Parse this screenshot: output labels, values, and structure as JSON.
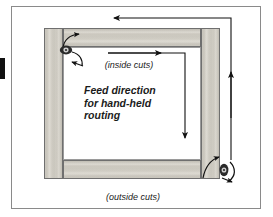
{
  "figure": {
    "title_text": "Feed direction for hand-held routing",
    "labels": {
      "inside_cuts": "(inside cuts)",
      "outside_cuts": "(outside cuts)",
      "feed_line1": "Feed direction",
      "feed_line2": "for hand-held",
      "feed_line3": "routing"
    },
    "colors": {
      "wood_light": "#dedbd3",
      "wood_mid": "#cbc8bf",
      "wood_dark": "#c6c3ba",
      "wood_outline": "#6f6f6f",
      "border": "#8a8a8a",
      "ink": "#111111",
      "background": "#ffffff"
    },
    "frame_parts": [
      {
        "name": "stile-left",
        "orientation": "vertical"
      },
      {
        "name": "stile-right",
        "orientation": "vertical"
      },
      {
        "name": "rail-top",
        "orientation": "horizontal"
      },
      {
        "name": "rail-bottom",
        "orientation": "horizontal"
      }
    ],
    "arrows": [
      {
        "name": "outside-top-arrow",
        "direction": "left",
        "path": "outside"
      },
      {
        "name": "outside-right-arrow",
        "direction": "up",
        "path": "outside"
      },
      {
        "name": "inside-top-arrow",
        "direction": "right",
        "path": "inside"
      },
      {
        "name": "inside-right-arrow",
        "direction": "down",
        "path": "inside"
      },
      {
        "name": "router-bit-top-left-entry-arrow",
        "direction": "right"
      },
      {
        "name": "router-bit-top-left-exit-arrow",
        "direction": "left"
      },
      {
        "name": "router-bit-bottom-right-entry-arrow",
        "direction": "right"
      },
      {
        "name": "router-bit-bottom-right-exit-arrow",
        "direction": "right"
      }
    ],
    "router_bits": [
      {
        "name": "router-bit-top-left",
        "rotation": "clockwise"
      },
      {
        "name": "router-bit-bottom-right",
        "rotation": "clockwise"
      }
    ]
  }
}
